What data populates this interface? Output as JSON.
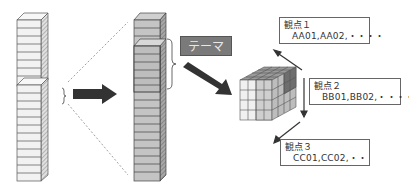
{
  "diagram": {
    "theme_label": "テーマ",
    "perspectives": [
      {
        "title": "観点１",
        "values": "AA01,AA02,・・・・"
      },
      {
        "title": "観点２",
        "values": "BB01,BB02,・・・・"
      },
      {
        "title": "観点３",
        "values": "CC01,CC02,・・"
      }
    ],
    "colors": {
      "left_column": "#f2f2f2",
      "middle_column": "#c4c4c4",
      "theme_tag": "#7a7a7a",
      "arrow": "#333333"
    }
  }
}
